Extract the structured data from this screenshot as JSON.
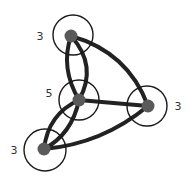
{
  "diagram": {
    "type": "multigraph",
    "nodes": [
      {
        "id": "top",
        "label": "3",
        "degree": 3
      },
      {
        "id": "middle",
        "label": "5",
        "degree": 5
      },
      {
        "id": "right",
        "label": "3",
        "degree": 3
      },
      {
        "id": "bottom-left",
        "label": "3",
        "degree": 3
      }
    ],
    "edges": [
      {
        "from": "top",
        "to": "middle",
        "count": 2
      },
      {
        "from": "top",
        "to": "right",
        "count": 1
      },
      {
        "from": "middle",
        "to": "right",
        "count": 1
      },
      {
        "from": "middle",
        "to": "bottom-left",
        "count": 2
      },
      {
        "from": "bottom-left",
        "to": "right",
        "count": 1
      }
    ],
    "colors": {
      "edge": "#222222",
      "node_dot": "#5a5a5a",
      "node_ring": "#1a1a1a",
      "label": "#333333"
    }
  }
}
